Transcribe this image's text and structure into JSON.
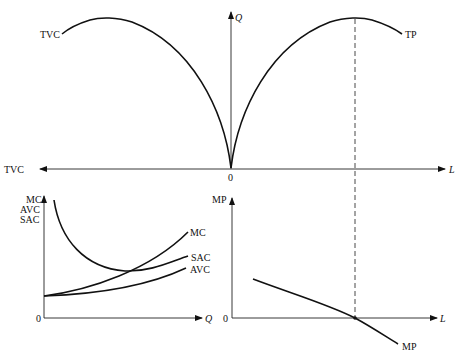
{
  "diagram": {
    "upper_panel": {
      "origin_label": "0",
      "right_axis_label": "L",
      "left_axis_label": "TVC",
      "vertical_axis_label": "Q",
      "curves": [
        {
          "name": "TP",
          "label": "TP"
        },
        {
          "name": "TVC",
          "label": "TVC"
        }
      ]
    },
    "lower_left_panel": {
      "origin_label": "0",
      "x_axis_label": "Q",
      "y_axis_labels": [
        "MC",
        "AVC",
        "SAC"
      ],
      "curves": [
        {
          "name": "MC",
          "label": "MC"
        },
        {
          "name": "SAC",
          "label": "SAC"
        },
        {
          "name": "AVC",
          "label": "AVC"
        }
      ]
    },
    "lower_right_panel": {
      "origin_label": "0",
      "x_axis_label": "L",
      "y_axis_label": "MP",
      "curves": [
        {
          "name": "MP",
          "label": "MP"
        }
      ]
    },
    "colors": {
      "line": "#111111",
      "background": "#ffffff"
    }
  }
}
